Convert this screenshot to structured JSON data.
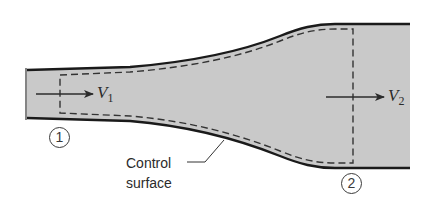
{
  "figure": {
    "inlet": {
      "velocity_symbol": "V",
      "velocity_subscript": "1",
      "section_label": "1"
    },
    "outlet": {
      "velocity_symbol": "V",
      "velocity_subscript": "2",
      "section_label": "2"
    },
    "control_surface_label": {
      "line1": "Control",
      "line2": "surface"
    }
  },
  "colors": {
    "fluid_fill": "#c9c9c9",
    "wall": "#1a1a1a",
    "dashed": "#333333",
    "text": "#2b2b2b"
  }
}
